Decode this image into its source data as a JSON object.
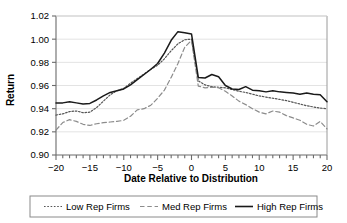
{
  "chart_data": {
    "type": "line",
    "title": "",
    "xlabel": "Date Relative to Distribution",
    "ylabel": "Return",
    "xlim": [
      -20,
      20
    ],
    "ylim": [
      0.9,
      1.02
    ],
    "ytick_step": 0.02,
    "xtick_step": 5,
    "xminor_tick_step": 1,
    "grid": "horizontal",
    "legend_position": "below",
    "ytick_labels": [
      "0.90",
      "0.92",
      "0.94",
      "0.96",
      "0.98",
      "1.00",
      "1.02"
    ],
    "ytick_values": [
      0.9,
      0.92,
      0.94,
      0.96,
      0.98,
      1.0,
      1.02
    ],
    "xtick_labels": [
      "−20",
      "−15",
      "−10",
      "−5",
      "0",
      "5",
      "10",
      "15",
      "20"
    ],
    "xtick_values": [
      -20,
      -15,
      -10,
      -5,
      0,
      5,
      10,
      15,
      20
    ],
    "x": [
      -20,
      -19,
      -18,
      -17,
      -16,
      -15,
      -14,
      -13,
      -12,
      -11,
      -10,
      -9,
      -8,
      -7,
      -6,
      -5,
      -4,
      -3,
      -2,
      -1,
      0,
      1,
      2,
      3,
      4,
      5,
      6,
      7,
      8,
      9,
      10,
      11,
      12,
      13,
      14,
      15,
      16,
      17,
      18,
      19,
      20
    ],
    "series": [
      {
        "name": "Low Rep Firms",
        "style": "dotted",
        "color": "#555555",
        "values": [
          0.9345,
          0.9355,
          0.9375,
          0.938,
          0.9365,
          0.937,
          0.941,
          0.9465,
          0.952,
          0.9555,
          0.9575,
          0.962,
          0.966,
          0.97,
          0.974,
          0.9775,
          0.983,
          0.99,
          0.996,
          0.9995,
          1.0,
          0.964,
          0.9605,
          0.959,
          0.9585,
          0.958,
          0.9565,
          0.955,
          0.954,
          0.9525,
          0.951,
          0.95,
          0.949,
          0.948,
          0.947,
          0.9455,
          0.944,
          0.9425,
          0.9415,
          0.9405,
          0.94
        ]
      },
      {
        "name": "Med Rep Firms",
        "style": "dashed",
        "color": "#8c8c8c",
        "values": [
          0.9215,
          0.928,
          0.9305,
          0.929,
          0.9265,
          0.9255,
          0.927,
          0.928,
          0.9285,
          0.929,
          0.93,
          0.9335,
          0.939,
          0.94,
          0.943,
          0.949,
          0.956,
          0.967,
          0.979,
          0.993,
          0.999,
          0.9595,
          0.958,
          0.9585,
          0.958,
          0.955,
          0.951,
          0.9465,
          0.9435,
          0.94,
          0.937,
          0.9355,
          0.938,
          0.937,
          0.934,
          0.932,
          0.93,
          0.9265,
          0.925,
          0.929,
          0.9225
        ]
      },
      {
        "name": "High Rep Firms",
        "style": "solid",
        "color": "#1a1a1a",
        "values": [
          0.945,
          0.945,
          0.946,
          0.945,
          0.944,
          0.9445,
          0.9475,
          0.951,
          0.954,
          0.9555,
          0.957,
          0.9605,
          0.965,
          0.9695,
          0.974,
          0.979,
          0.988,
          0.999,
          1.0065,
          1.0055,
          1.0045,
          0.967,
          0.9665,
          0.9695,
          0.9675,
          0.96,
          0.957,
          0.9565,
          0.959,
          0.956,
          0.9555,
          0.9545,
          0.9555,
          0.9545,
          0.954,
          0.9535,
          0.9525,
          0.9535,
          0.9525,
          0.952,
          0.946
        ]
      }
    ]
  },
  "legend": {
    "items": [
      {
        "label": "Low Rep Firms"
      },
      {
        "label": "Med Rep Firms"
      },
      {
        "label": "High Rep Firms"
      }
    ]
  }
}
